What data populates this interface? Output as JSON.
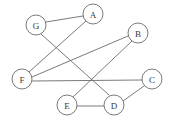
{
  "figure": {
    "width": 170,
    "height": 124,
    "background_color": "#ffffff",
    "stroke_color": "#6b6b6b",
    "label_color": "#3a3a3a",
    "node_radius": 10
  },
  "nodes": [
    {
      "id": "A",
      "label": "A",
      "cx": 93,
      "cy": 14
    },
    {
      "id": "B",
      "label": "B",
      "cx": 138,
      "cy": 33
    },
    {
      "id": "C",
      "label": "C",
      "cx": 152,
      "cy": 79
    },
    {
      "id": "D",
      "label": "D",
      "cx": 114,
      "cy": 105
    },
    {
      "id": "E",
      "label": "E",
      "cx": 67,
      "cy": 105
    },
    {
      "id": "F",
      "label": "F",
      "cx": 22,
      "cy": 79
    },
    {
      "id": "G",
      "label": "G",
      "cx": 36,
      "cy": 25
    }
  ],
  "edges": [
    {
      "id": "edge-g-a",
      "from": "G",
      "to": "A",
      "x1": 46,
      "y1": 22,
      "x2": 83,
      "y2": 16
    },
    {
      "id": "edge-g-d",
      "from": "G",
      "to": "D",
      "x1": 41,
      "y1": 34,
      "x2": 109,
      "y2": 95
    },
    {
      "id": "edge-a-f",
      "from": "A",
      "to": "F",
      "x1": 86,
      "y1": 21,
      "x2": 29,
      "y2": 72
    },
    {
      "id": "edge-f-b",
      "from": "F",
      "to": "B",
      "x1": 32,
      "y1": 77,
      "x2": 128,
      "y2": 36
    },
    {
      "id": "edge-f-c",
      "from": "F",
      "to": "C",
      "x1": 32,
      "y1": 81,
      "x2": 142,
      "y2": 80
    },
    {
      "id": "edge-b-e",
      "from": "B",
      "to": "E",
      "x1": 132,
      "y1": 41,
      "x2": 73,
      "y2": 97
    },
    {
      "id": "edge-e-d",
      "from": "E",
      "to": "D",
      "x1": 77,
      "y1": 106,
      "x2": 104,
      "y2": 106
    },
    {
      "id": "edge-d-c",
      "from": "D",
      "to": "C",
      "x1": 123,
      "y1": 101,
      "x2": 144,
      "y2": 86
    }
  ]
}
